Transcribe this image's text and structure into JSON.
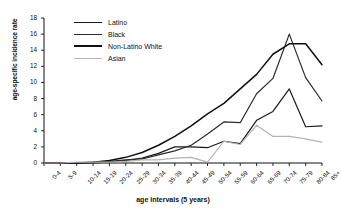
{
  "chart_data": {
    "type": "line",
    "title": "",
    "xlabel": "age intervals (5 years)",
    "ylabel": "age-specific incidence rate",
    "ylim": [
      0,
      18
    ],
    "yticks": [
      0,
      2,
      4,
      6,
      8,
      10,
      12,
      14,
      16,
      18
    ],
    "grid": false,
    "legend_position": "top-left",
    "categories": [
      "0-4",
      "5-9",
      "10-14",
      "15-19",
      "20-24",
      "25-29",
      "30-34",
      "35-39",
      "40-44",
      "45-49",
      "50-54",
      "55-59",
      "60-64",
      "65-69",
      "70-74",
      "75-79",
      "80-84",
      "85+"
    ],
    "series": [
      {
        "name": "Latino",
        "color": "#1a1a1a",
        "values": [
          0,
          0,
          0,
          0,
          0.1,
          0.3,
          0.6,
          1.2,
          2.0,
          2.0,
          1.9,
          2.7,
          2.4,
          5.3,
          6.4,
          9.2,
          4.5,
          4.6
        ]
      },
      {
        "name": "Black",
        "color": "#2b2b2b",
        "values": [
          0,
          0,
          0,
          0.1,
          0.2,
          0.4,
          0.5,
          1.0,
          1.5,
          2.2,
          3.6,
          5.1,
          5.0,
          8.6,
          10.5,
          16.0,
          10.6,
          7.7
        ]
      },
      {
        "name": "Non-Latino White",
        "color": "#111111",
        "values": [
          0,
          0,
          0,
          0.1,
          0.3,
          0.7,
          1.3,
          2.2,
          3.3,
          4.6,
          6.1,
          7.4,
          9.2,
          11.0,
          13.5,
          14.8,
          14.8,
          12.2
        ]
      },
      {
        "name": "Asian",
        "color": "#b4b4b4",
        "values": [
          0,
          0,
          0.1,
          0.1,
          0.1,
          0.2,
          0.4,
          0.4,
          0.6,
          0.7,
          0.1,
          2.7,
          2.3,
          4.7,
          3.3,
          3.3,
          3.0,
          2.6
        ]
      }
    ]
  },
  "axis": {
    "y_title": "age-specific incidence rate",
    "x_title": "age intervals (5 years)"
  },
  "legend": {
    "items": [
      {
        "label": "Latino",
        "color": "#1a1a1a",
        "weight": "1.6"
      },
      {
        "label": "Black",
        "color": "#2b2b2b",
        "weight": "1.6"
      },
      {
        "label": "Non-Latino White",
        "color": "#111111",
        "weight": "2.2"
      },
      {
        "label": "Asian",
        "color": "#b4b4b4",
        "weight": "1.6"
      }
    ]
  }
}
